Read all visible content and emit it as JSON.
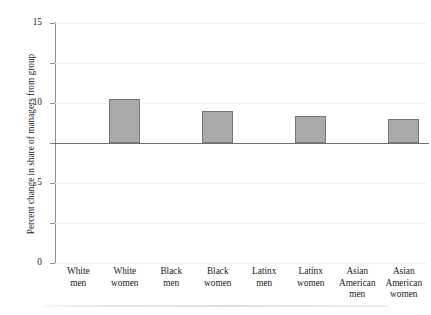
{
  "figure": {
    "top_sliver_text": "",
    "page_rule": true
  },
  "chart_data": {
    "type": "bar",
    "title": "",
    "subtitle": "",
    "xlabel": "",
    "ylabel": "Percent change in share of managers from group",
    "categories": [
      "White\nmen",
      "White\nwomen",
      "Black\nmen",
      "Black\nwomen",
      "Latinx\nmen",
      "Latinx\nwomen",
      "Asian\nAmerican\nmen",
      "Asian\nAmerican\nwomen"
    ],
    "values": [
      0,
      5.5,
      0,
      4.0,
      0,
      3.4,
      0,
      3.0
    ],
    "ylim": [
      -15,
      15
    ],
    "yticks": [
      15,
      10,
      5,
      0,
      -5,
      -10,
      -15
    ],
    "ytick_labels": [
      "15",
      "10",
      "5",
      "0",
      "−5",
      "−10",
      "−15"
    ],
    "grid": "horizontal",
    "legend": "none",
    "bar_color": "#a9a9a9",
    "bar_edge_color": "#777777",
    "zero_line_color": "#6f6f6f",
    "gridline_color": "#f1f1f3",
    "axis_color": "#8d8d8d"
  }
}
